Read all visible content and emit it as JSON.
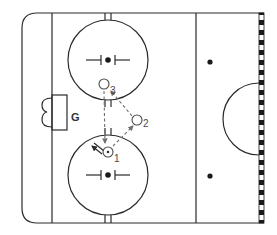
{
  "diagram": {
    "colors": {
      "line": "#2b2b2b",
      "pass": "#6e6e6e",
      "background": "#ffffff"
    },
    "goal_label": "G",
    "players": [
      {
        "id": "1",
        "label": "1",
        "x": 108,
        "y": 152,
        "has_puck": true
      },
      {
        "id": "2",
        "label": "2",
        "x": 137,
        "y": 120,
        "has_puck": false
      },
      {
        "id": "3",
        "label": "3",
        "x": 104,
        "y": 84,
        "has_puck": false
      }
    ],
    "passes": [
      {
        "from": "1",
        "to": "2",
        "style": "dashed"
      },
      {
        "from": "2",
        "to": "3",
        "style": "dashed"
      },
      {
        "from": "3",
        "to": "1",
        "style": "dashed"
      }
    ],
    "skate_paths": [
      {
        "from": "1",
        "direction": "up-left",
        "style": "solid"
      }
    ],
    "faceoff_circles": [
      {
        "name": "top",
        "cx": 108,
        "cy": 60,
        "r": 40
      },
      {
        "name": "bottom",
        "cx": 108,
        "cy": 175,
        "r": 40
      }
    ],
    "neutral_dots": [
      {
        "cx": 210,
        "cy": 62
      },
      {
        "cx": 210,
        "cy": 176
      }
    ],
    "center_circle": {
      "cx": 261,
      "cy": 119,
      "r": 36
    }
  }
}
